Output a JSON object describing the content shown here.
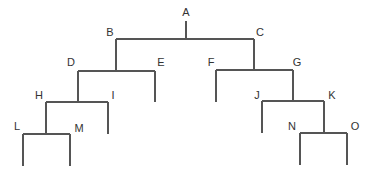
{
  "diagram": {
    "type": "binary-tree",
    "line_color": "#555555",
    "label_color": "#333333",
    "nodes": [
      {
        "id": "A",
        "label": "A",
        "x": 186,
        "y": 39,
        "lx": 186,
        "ly": 16
      },
      {
        "id": "B",
        "label": "B",
        "x": 116,
        "y": 71,
        "lx": 110,
        "ly": 36,
        "parent": "A"
      },
      {
        "id": "C",
        "label": "C",
        "x": 254,
        "y": 70,
        "lx": 260,
        "ly": 36,
        "parent": "A"
      },
      {
        "id": "D",
        "label": "D",
        "x": 78,
        "y": 102,
        "lx": 71,
        "ly": 66,
        "parent": "B"
      },
      {
        "id": "E",
        "label": "E",
        "x": 155,
        "y": 102,
        "lx": 161,
        "ly": 66,
        "parent": "B"
      },
      {
        "id": "F",
        "label": "F",
        "x": 216,
        "y": 102,
        "lx": 211,
        "ly": 66,
        "parent": "C"
      },
      {
        "id": "G",
        "label": "G",
        "x": 293,
        "y": 101,
        "lx": 297,
        "ly": 66,
        "parent": "C"
      },
      {
        "id": "H",
        "label": "H",
        "x": 46,
        "y": 134,
        "lx": 39,
        "ly": 99,
        "parent": "D"
      },
      {
        "id": "I",
        "label": "I",
        "x": 108,
        "y": 134,
        "lx": 113,
        "ly": 99,
        "parent": "D"
      },
      {
        "id": "J",
        "label": "J",
        "x": 262,
        "y": 133,
        "lx": 257,
        "ly": 99,
        "parent": "G"
      },
      {
        "id": "K",
        "label": "K",
        "x": 324,
        "y": 133,
        "lx": 332,
        "ly": 99,
        "parent": "G"
      },
      {
        "id": "L",
        "label": "L",
        "x": 23,
        "y": 166,
        "lx": 17,
        "ly": 130,
        "parent": "H"
      },
      {
        "id": "M",
        "label": "M",
        "x": 70,
        "y": 166,
        "lx": 79,
        "ly": 132,
        "parent": "H"
      },
      {
        "id": "N",
        "label": "N",
        "x": 300,
        "y": 165,
        "lx": 292,
        "ly": 130,
        "parent": "K"
      },
      {
        "id": "O",
        "label": "O",
        "x": 347,
        "y": 165,
        "lx": 355,
        "ly": 130,
        "parent": "K"
      }
    ],
    "root_stem": {
      "x": 186,
      "y1": 21,
      "y2": 39
    },
    "junctions": [
      {
        "parent": "A",
        "y": 39,
        "x1": 116,
        "x2": 254
      },
      {
        "parent": "B",
        "y": 71,
        "x1": 78,
        "x2": 155,
        "stem_x": 116,
        "stem_top": 39
      },
      {
        "parent": "C",
        "y": 70,
        "x1": 216,
        "x2": 293,
        "stem_x": 254,
        "stem_top": 39
      },
      {
        "parent": "D",
        "y": 102,
        "x1": 46,
        "x2": 108,
        "stem_x": 78,
        "stem_top": 71
      },
      {
        "parent": "G",
        "y": 101,
        "x1": 262,
        "x2": 324,
        "stem_x": 293,
        "stem_top": 70
      },
      {
        "parent": "H",
        "y": 134,
        "x1": 23,
        "x2": 70,
        "stem_x": 46,
        "stem_top": 102
      },
      {
        "parent": "K",
        "y": 133,
        "x1": 300,
        "x2": 347,
        "stem_x": 324,
        "stem_top": 101
      }
    ],
    "leaf_stems": [
      {
        "id": "E",
        "x": 155,
        "y1": 71,
        "y2": 102
      },
      {
        "id": "F",
        "x": 216,
        "y1": 70,
        "y2": 102
      },
      {
        "id": "I",
        "x": 108,
        "y1": 102,
        "y2": 134
      },
      {
        "id": "J",
        "x": 262,
        "y1": 101,
        "y2": 133
      },
      {
        "id": "L",
        "x": 23,
        "y1": 134,
        "y2": 166
      },
      {
        "id": "M",
        "x": 70,
        "y1": 134,
        "y2": 166
      },
      {
        "id": "N",
        "x": 300,
        "y1": 133,
        "y2": 165
      },
      {
        "id": "O",
        "x": 347,
        "y1": 133,
        "y2": 165
      }
    ]
  }
}
